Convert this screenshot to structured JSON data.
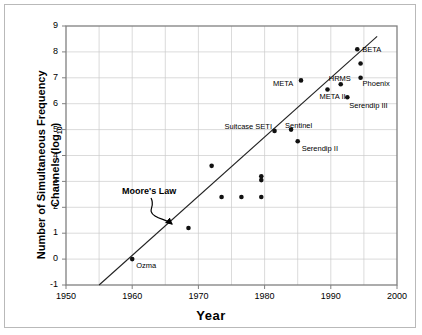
{
  "chart_data": {
    "type": "scatter",
    "title": "",
    "xlabel": "Year",
    "ylabel": "Number of Simultaneous Frequency Channels (log10)",
    "ylabel_main": "Number of Simultaneous Frequency",
    "ylabel_second": "Channels (log",
    "ylabel_sub": "10",
    "ylabel_close": ")",
    "xlim": [
      1950,
      2000
    ],
    "ylim": [
      -1,
      9
    ],
    "x_ticks": [
      1950,
      1960,
      1970,
      1980,
      1990,
      2000
    ],
    "y_ticks": [
      -1,
      0,
      1,
      2,
      3,
      4,
      5,
      6,
      7,
      8,
      9
    ],
    "x_minor_step": 5,
    "y_minor_step": 1,
    "grid": true,
    "legend": "none",
    "marker_color": "#111111",
    "grid_color": "#cccccc",
    "axis_color": "#808080",
    "trend_line": {
      "name": "Moore's Law",
      "annotation": "Moore's Law",
      "x_start": 1955,
      "y_start": -1,
      "x_end": 1997,
      "y_end": 8.6
    },
    "points": [
      {
        "label": "Ozma",
        "x": 1960,
        "y": 0.0,
        "label_dx": 4,
        "label_dy": 7
      },
      {
        "label": "",
        "x": 1968.5,
        "y": 1.2,
        "label_dx": 0,
        "label_dy": 0
      },
      {
        "label": "",
        "x": 1973.5,
        "y": 2.4,
        "label_dx": 0,
        "label_dy": 0
      },
      {
        "label": "",
        "x": 1976.5,
        "y": 2.4,
        "label_dx": 0,
        "label_dy": 0
      },
      {
        "label": "",
        "x": 1972,
        "y": 3.6,
        "label_dx": 0,
        "label_dy": 0
      },
      {
        "label": "",
        "x": 1979.5,
        "y": 2.4,
        "label_dx": 0,
        "label_dy": 0
      },
      {
        "label": "",
        "x": 1979.5,
        "y": 3.05,
        "label_dx": 0,
        "label_dy": 0
      },
      {
        "label": "",
        "x": 1979.5,
        "y": 3.2,
        "label_dx": 0,
        "label_dy": 0
      },
      {
        "label": "Suitcase SETI",
        "x": 1981.5,
        "y": 4.95,
        "label_dx": -50,
        "label_dy": -4
      },
      {
        "label": "Sentinel",
        "x": 1984,
        "y": 5.0,
        "label_dx": -6,
        "label_dy": -4
      },
      {
        "label": "Serendip II",
        "x": 1985,
        "y": 4.55,
        "label_dx": 4,
        "label_dy": 8
      },
      {
        "label": "META",
        "x": 1985.5,
        "y": 6.9,
        "label_dx": -28,
        "label_dy": 4
      },
      {
        "label": "META II",
        "x": 1989.5,
        "y": 6.55,
        "label_dx": -8,
        "label_dy": 8
      },
      {
        "label": "HRMS",
        "x": 1991.5,
        "y": 6.75,
        "label_dx": -12,
        "label_dy": -5
      },
      {
        "label": "Serendip III",
        "x": 1992.5,
        "y": 6.25,
        "label_dx": 2,
        "label_dy": 9
      },
      {
        "label": "Phoenix",
        "x": 1994.5,
        "y": 7.0,
        "label_dx": 2,
        "label_dy": 6
      },
      {
        "label": "",
        "x": 1994.5,
        "y": 7.55,
        "label_dx": 0,
        "label_dy": 0
      },
      {
        "label": "BETA",
        "x": 1994,
        "y": 8.1,
        "label_dx": 5,
        "label_dy": 1
      }
    ]
  }
}
